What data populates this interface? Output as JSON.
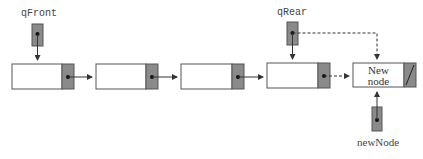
{
  "diagram": {
    "type": "linked-queue-enqueue",
    "pointers": {
      "front": {
        "label": "qFront"
      },
      "rear": {
        "label": "qRear"
      },
      "new": {
        "label": "newNode"
      }
    },
    "nodes": [
      {
        "id": "node-1",
        "text": ""
      },
      {
        "id": "node-2",
        "text": ""
      },
      {
        "id": "node-3",
        "text": ""
      },
      {
        "id": "node-4",
        "text": ""
      },
      {
        "id": "node-new",
        "text_line1": "New",
        "text_line2": "node",
        "next": "null"
      }
    ],
    "colors": {
      "pointer_fill": "#8a8a8a",
      "node_border": "#555555",
      "line": "#333333"
    }
  }
}
